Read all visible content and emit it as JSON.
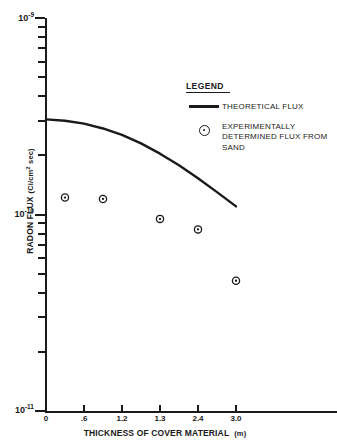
{
  "chart_data": {
    "type": "scatter",
    "title": "",
    "xlabel": "THICKNESS OF COVER MATERIAL",
    "xunit": "(m)",
    "ylabel": "RADON FLUX",
    "yunit": "(Ci/cm2 sec)",
    "yunit_base": "(Ci/cm",
    "yunit_sup": "2",
    "yunit_tail": " sec)",
    "yscale": "log",
    "ylim": [
      1e-11,
      1e-09
    ],
    "grid": false,
    "legend_position": "upper-right",
    "x_tick_labels": [
      "0",
      ".6",
      "1.2",
      "1.3",
      "2.4",
      "3.0"
    ],
    "x_tick_values": [
      0,
      0.6,
      1.2,
      1.3,
      2.4,
      3.0
    ],
    "y_tick_labels": [
      "10-9",
      "10-10",
      "10-11"
    ],
    "y_major_decades": [
      {
        "mantissa_label": "10",
        "exponent_label": "-9",
        "value": 1e-09
      },
      {
        "mantissa_label": "10",
        "exponent_label": "-10",
        "value": 1e-10
      },
      {
        "mantissa_label": "10",
        "exponent_label": "-11",
        "value": 1e-11
      }
    ],
    "y_minor_ticks": [
      9e-10,
      8e-10,
      7e-10,
      6e-10,
      5e-10,
      4e-10,
      3e-10,
      2e-10,
      9e-11,
      8e-11,
      7e-11,
      6e-11,
      5e-11,
      4e-11,
      3e-11,
      2e-11
    ],
    "series": [
      {
        "name": "THEORETICAL FLUX",
        "type": "line",
        "color": "#1a1a1a",
        "x": [
          0.0,
          0.3,
          0.6,
          0.9,
          1.2,
          1.5,
          1.8,
          2.1,
          2.4,
          2.7,
          3.0
        ],
        "y": [
          3.05e-10,
          3e-10,
          2.9e-10,
          2.74e-10,
          2.54e-10,
          2.3e-10,
          2.04e-10,
          1.78e-10,
          1.53e-10,
          1.3e-10,
          1.1e-10
        ]
      },
      {
        "name": "EXPERIMENTALLY DETERMINED FLUX FROM SAND",
        "type": "scatter",
        "color": "#1a1a1a",
        "marker": "circle-dot",
        "x": [
          0.3,
          0.9,
          1.8,
          2.4,
          3.0
        ],
        "y": [
          1.22e-10,
          1.2e-10,
          9.5e-11,
          8.4e-11,
          4.6e-11
        ]
      }
    ]
  },
  "legend": {
    "title": "LEGEND",
    "entries": [
      {
        "key": "line-sample",
        "lines": [
          "THEORETICAL FLUX"
        ]
      },
      {
        "key": "circle-dot-marker",
        "lines": [
          "EXPERIMENTALLY",
          "DETERMINED FLUX FROM",
          "SAND"
        ]
      }
    ]
  },
  "colors": {
    "ink": "#1a1a1a",
    "background": "#ffffff"
  }
}
